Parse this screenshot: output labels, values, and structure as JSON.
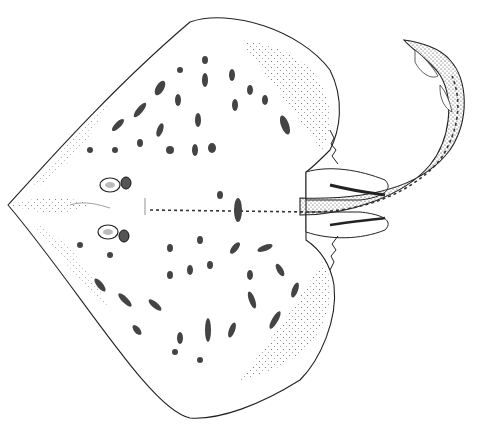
{
  "image": {
    "subject": "skate (ray) scientific illustration, dorsal view",
    "background": "#ffffff",
    "ink_color": "#1a1a1a"
  }
}
